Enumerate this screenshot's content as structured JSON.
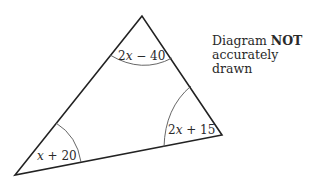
{
  "figure": {
    "type": "triangle",
    "note": {
      "prefix": "Diagram ",
      "emphasis": "NOT",
      "line2": "accurately drawn"
    },
    "angles": [
      {
        "vertex": "top",
        "coef": "2",
        "var": "x",
        "op": " − ",
        "const": "40"
      },
      {
        "vertex": "bottom-left",
        "coef": "",
        "var": "x",
        "op": " + ",
        "const": "20"
      },
      {
        "vertex": "right",
        "coef": "2",
        "var": "x",
        "op": " + ",
        "const": "15"
      }
    ],
    "colors": {
      "stroke": "#222222",
      "arc": "#555555",
      "text": "#2a2a2a"
    }
  }
}
